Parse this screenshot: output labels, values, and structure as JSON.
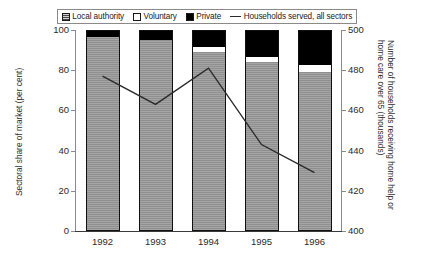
{
  "chart_data": {
    "type": "bar",
    "subtype": "stacked-bar-with-line-overlay",
    "title": "",
    "categories": [
      "1992",
      "1993",
      "1994",
      "1995",
      "1996"
    ],
    "xlabel": "",
    "ylabel": "Sectoral share of market (per cent)",
    "ylabel_right": "Number of households receiving home help or home care over 65 (thousands)",
    "ylim": [
      0,
      100
    ],
    "ylim_right": [
      400,
      500
    ],
    "yticks": [
      0,
      20,
      40,
      60,
      80,
      100
    ],
    "yticks_right": [
      400,
      420,
      440,
      460,
      480,
      500
    ],
    "grid": false,
    "legend_position": "top",
    "series": [
      {
        "name": "Local authority",
        "type": "bar-segment",
        "axis": "left",
        "color": "#9a9a9a",
        "values": [
          96.5,
          95.0,
          89.0,
          84.0,
          79.0
        ]
      },
      {
        "name": "Voluntary",
        "type": "bar-segment",
        "axis": "left",
        "color": "#ffffff",
        "values": [
          0.0,
          0.0,
          2.5,
          2.5,
          3.5
        ]
      },
      {
        "name": "Private",
        "type": "bar-segment",
        "axis": "left",
        "color": "#000000",
        "values": [
          3.5,
          5.0,
          8.5,
          13.5,
          17.5
        ]
      },
      {
        "name": "Households served, all sectors",
        "type": "line",
        "axis": "right",
        "color": "#2b2b2b",
        "values": [
          477,
          463,
          481,
          443,
          429
        ]
      }
    ]
  },
  "legend": {
    "items": [
      {
        "label": "Local authority",
        "swatch": "hatched-gray-square-icon"
      },
      {
        "label": "Voluntary",
        "swatch": "white-square-icon"
      },
      {
        "label": "Private",
        "swatch": "black-square-icon"
      },
      {
        "label": "Households served, all sectors",
        "swatch": "line-segment-icon"
      }
    ]
  },
  "axes": {
    "left": {
      "title": "Sectoral share of market (per cent)",
      "ticks": [
        "0",
        "20",
        "40",
        "60",
        "80",
        "100"
      ]
    },
    "right": {
      "title": "Number of households receiving home help or home care over 65 (thousands)",
      "ticks": [
        "400",
        "420",
        "440",
        "460",
        "480",
        "500"
      ]
    },
    "bottom": {
      "ticks": [
        "1992",
        "1993",
        "1994",
        "1995",
        "1996"
      ]
    }
  }
}
